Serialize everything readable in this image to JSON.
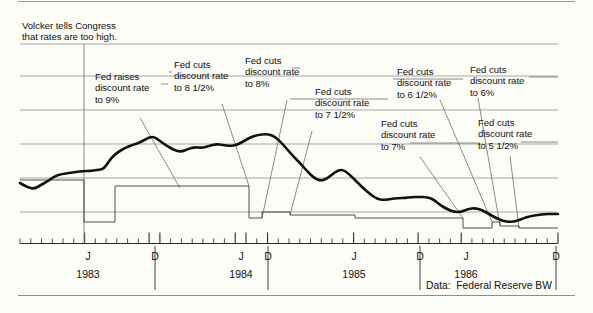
{
  "figure": {
    "source_note": "Data:  Federal Reserve BW",
    "colors": {
      "background": "#fdfdf8",
      "rate_line": "#111111",
      "step_line": "#3a3a3a",
      "gridline": "#9c9c98",
      "axis": "#2b2b2b",
      "leader": "#7d7d79"
    }
  },
  "annotations": [
    {
      "id": "volcker",
      "text": "Volcker tells Congress\nthat rates are too high.",
      "x": 22,
      "y": 20,
      "leader": [
        [
          84,
          44
        ],
        [
          84,
          243
        ]
      ]
    },
    {
      "id": "raise-9",
      "text": "Fed raises\ndiscount rate\nto 9%",
      "x": 95,
      "y": 71,
      "leader": [
        [
          161,
          84
        ],
        [
          168,
          84
        ]
      ],
      "pointer": [
        [
          140,
          118
        ],
        [
          180,
          188
        ]
      ]
    },
    {
      "id": "cut-8half",
      "text": "Fed cuts\ndiscount rate\nto 8 1/2%",
      "x": 174,
      "y": 59,
      "leader": [
        [
          169,
          72
        ],
        [
          172,
          72
        ]
      ],
      "pointer": [
        [
          222,
          104
        ],
        [
          249,
          186
        ]
      ]
    },
    {
      "id": "cut-8",
      "text": "Fed cuts\ndiscount rate\nto 8%",
      "x": 245,
      "y": 55,
      "leader": [
        [
          292,
          68
        ],
        [
          300,
          68
        ]
      ],
      "pointer": [
        [
          287,
          100
        ],
        [
          262,
          218
        ]
      ]
    },
    {
      "id": "cut-7half",
      "text": "Fed cuts\ndiscount rate\nto 7 1/2%",
      "x": 315,
      "y": 86,
      "leader": [
        [
          290,
          99
        ],
        [
          388,
          99
        ]
      ],
      "pointer": [
        [
          312,
          131
        ],
        [
          290,
          215
        ]
      ]
    },
    {
      "id": "cut-7",
      "text": "Fed cuts\ndiscount rate\nto 7%",
      "x": 381,
      "y": 118,
      "leader": [
        [
          410,
          143
        ],
        [
          480,
          143
        ]
      ],
      "pointer": [
        [
          420,
          157
        ],
        [
          463,
          218
        ]
      ]
    },
    {
      "id": "cut-6half",
      "text": "Fed cuts\ndiscount rate\nto 6 1/2%",
      "x": 397,
      "y": 66,
      "leader": [
        [
          393,
          79
        ],
        [
          463,
          79
        ]
      ],
      "pointer": [
        [
          440,
          100
        ],
        [
          492,
          222
        ]
      ]
    },
    {
      "id": "cut-6",
      "text": "Fed cuts\ndiscount rate\nto 6%",
      "x": 470,
      "y": 64,
      "leader": [
        [
          529,
          77
        ],
        [
          558,
          77
        ]
      ],
      "pointer": [
        [
          478,
          98
        ],
        [
          500,
          226
        ]
      ]
    },
    {
      "id": "cut-5half",
      "text": "Fed cuts\ndiscount rate\nto 5 1/2%",
      "x": 478,
      "y": 117,
      "leader": [
        [
          521,
          142
        ],
        [
          558,
          142
        ]
      ],
      "pointer": [
        [
          510,
          156
        ],
        [
          519,
          228
        ]
      ]
    }
  ],
  "chart_data": {
    "type": "line",
    "title": "",
    "subtitle": "",
    "xlabel": "",
    "ylabel": "",
    "grid": true,
    "legend_position": "none",
    "xlim": [
      "1982-11",
      "1986-12"
    ],
    "x_axis": {
      "tick_interval": "monthly",
      "major_labels": [
        {
          "label": "J",
          "year": "1983",
          "x": 88
        },
        {
          "label": "D",
          "year": "",
          "x": 155
        },
        {
          "label": "J",
          "year": "1984",
          "x": 241
        },
        {
          "label": "D",
          "year": "",
          "x": 268
        },
        {
          "label": "J",
          "year": "1985",
          "x": 354
        },
        {
          "label": "D",
          "year": "",
          "x": 420
        },
        {
          "label": "J",
          "year": "1986",
          "x": 466
        },
        {
          "label": "D",
          "year": "",
          "x": 556
        }
      ],
      "year_labels": [
        {
          "text": "1983",
          "x": 88
        },
        {
          "text": "1984",
          "x": 241
        },
        {
          "text": "1985",
          "x": 354
        },
        {
          "text": "1986",
          "x": 466
        }
      ],
      "separators": [
        155,
        268,
        420,
        556
      ]
    },
    "y_axis": {
      "gridlines_px": [
        44,
        76,
        110,
        144,
        178,
        212
      ],
      "tick_count": 6,
      "labels": []
    },
    "series": [
      {
        "name": "Market interest rate",
        "style": "thick-line",
        "points_px": [
          [
            20,
            183
          ],
          [
            27,
            187
          ],
          [
            34,
            189
          ],
          [
            41,
            185
          ],
          [
            48,
            181
          ],
          [
            55,
            176
          ],
          [
            62,
            174
          ],
          [
            69,
            173
          ],
          [
            76,
            172
          ],
          [
            83,
            171
          ],
          [
            90,
            171
          ],
          [
            97,
            170
          ],
          [
            104,
            169
          ],
          [
            111,
            158
          ],
          [
            118,
            152
          ],
          [
            125,
            148
          ],
          [
            132,
            145
          ],
          [
            139,
            143
          ],
          [
            146,
            139
          ],
          [
            153,
            136
          ],
          [
            160,
            141
          ],
          [
            167,
            146
          ],
          [
            174,
            150
          ],
          [
            181,
            152
          ],
          [
            188,
            149
          ],
          [
            195,
            147
          ],
          [
            202,
            148
          ],
          [
            209,
            146
          ],
          [
            216,
            144
          ],
          [
            223,
            145
          ],
          [
            230,
            146
          ],
          [
            237,
            145
          ],
          [
            244,
            141
          ],
          [
            251,
            137
          ],
          [
            258,
            135
          ],
          [
            265,
            134
          ],
          [
            272,
            135
          ],
          [
            279,
            140
          ],
          [
            286,
            148
          ],
          [
            293,
            156
          ],
          [
            300,
            163
          ],
          [
            307,
            171
          ],
          [
            314,
            178
          ],
          [
            321,
            181
          ],
          [
            328,
            178
          ],
          [
            335,
            172
          ],
          [
            342,
            169
          ],
          [
            349,
            174
          ],
          [
            356,
            181
          ],
          [
            363,
            188
          ],
          [
            370,
            194
          ],
          [
            377,
            199
          ],
          [
            384,
            200
          ],
          [
            391,
            199
          ],
          [
            398,
            198
          ],
          [
            405,
            198
          ],
          [
            412,
            197
          ],
          [
            419,
            197
          ],
          [
            426,
            197
          ],
          [
            433,
            199
          ],
          [
            440,
            205
          ],
          [
            447,
            209
          ],
          [
            454,
            212
          ],
          [
            461,
            212
          ],
          [
            468,
            209
          ],
          [
            475,
            208
          ],
          [
            482,
            210
          ],
          [
            489,
            214
          ],
          [
            496,
            218
          ],
          [
            503,
            221
          ],
          [
            510,
            222
          ],
          [
            517,
            221
          ],
          [
            524,
            218
          ],
          [
            531,
            216
          ],
          [
            538,
            215
          ],
          [
            545,
            214
          ],
          [
            552,
            214
          ],
          [
            558,
            214
          ]
        ]
      },
      {
        "name": "Fed discount rate",
        "style": "thin-step",
        "steps_px": [
          [
            20,
            180
          ],
          [
            84,
            180
          ],
          [
            84,
            222
          ],
          [
            115,
            222
          ],
          [
            115,
            186
          ],
          [
            249,
            186
          ],
          [
            249,
            218
          ],
          [
            262,
            218
          ],
          [
            262,
            212
          ],
          [
            290,
            212
          ],
          [
            290,
            215
          ],
          [
            355,
            215
          ],
          [
            355,
            218
          ],
          [
            463,
            218
          ],
          [
            463,
            228
          ],
          [
            492,
            228
          ],
          [
            492,
            222
          ],
          [
            500,
            222
          ],
          [
            500,
            226
          ],
          [
            519,
            226
          ],
          [
            519,
            228
          ],
          [
            558,
            228
          ]
        ]
      }
    ]
  }
}
